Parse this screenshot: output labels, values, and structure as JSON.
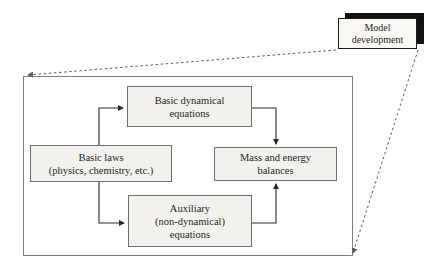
{
  "callout": {
    "label": "Model\ndevelopment"
  },
  "diagram": {
    "boxes": [
      {
        "id": "basic-dynamical-equations",
        "label": "Basic dynamical\nequations"
      },
      {
        "id": "basic-laws",
        "label": "Basic laws\n(physics, chemistry, etc.)"
      },
      {
        "id": "mass-and-energy-balances",
        "label": "Mass and energy\nbalances"
      },
      {
        "id": "auxiliary-equations",
        "label": "Auxiliary\n(non-dynamical)\nequations"
      }
    ],
    "connections": [
      {
        "from": "basic-laws",
        "to": "basic-dynamical-equations",
        "style": "solid-arrow"
      },
      {
        "from": "basic-laws",
        "to": "auxiliary-equations",
        "style": "solid-arrow"
      },
      {
        "from": "basic-dynamical-equations",
        "to": "mass-and-energy-balances",
        "style": "solid-arrow"
      },
      {
        "from": "auxiliary-equations",
        "to": "mass-and-energy-balances",
        "style": "solid-arrow"
      },
      {
        "from": "callout-model-development",
        "to": "panel-top-left",
        "style": "dashed-arrow"
      },
      {
        "from": "callout-model-development",
        "to": "panel-bottom-right",
        "style": "dashed-arrow"
      }
    ]
  },
  "colors": {
    "background": "#ffffff",
    "box_fill": "#f2f1ed",
    "box_border": "#6e6e6e",
    "panel_border": "#7d7d7d",
    "connector": "#2a2a2a",
    "dashed": "#5c5c5c",
    "callout_fill": "#faf9f6",
    "callout_border": "#1c1c1c",
    "callout_shadow": "#121212",
    "text": "#262626"
  }
}
